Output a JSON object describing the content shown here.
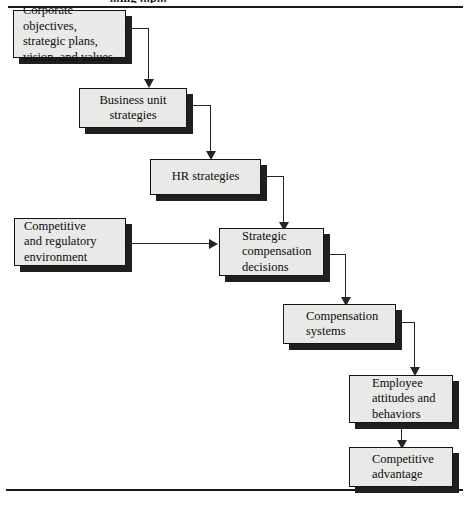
{
  "figure": {
    "title_partial": "...ing ...p...",
    "background_color": "#ffffff",
    "box_fill_color": "#e9e9e7",
    "box_border_color": "#16150f",
    "shadow_color": "#201f1d",
    "connector_color": "#242424"
  },
  "nodes": [
    {
      "id": "corporate-objectives",
      "label": "Corporate objectives,\nstrategic plans,\nvision, and values"
    },
    {
      "id": "business-unit-strategies",
      "label": "Business unit\nstrategies"
    },
    {
      "id": "hr-strategies",
      "label": "HR strategies"
    },
    {
      "id": "competitive-regulatory-environment",
      "label": "Competitive\nand regulatory\nenvironment"
    },
    {
      "id": "strategic-compensation-decisions",
      "label": "Strategic\ncompensation\ndecisions"
    },
    {
      "id": "compensation-systems",
      "label": "Compensation\nsystems"
    },
    {
      "id": "employee-attitudes-behaviors",
      "label": "Employee\nattitudes and\nbehaviors"
    },
    {
      "id": "competitive-advantage",
      "label": "Competitive\nadvantage"
    }
  ],
  "edges": [
    {
      "id": "edge-1",
      "from": "corporate-objectives",
      "to": "business-unit-strategies",
      "kind": "elbow-down"
    },
    {
      "id": "edge-2",
      "from": "business-unit-strategies",
      "to": "hr-strategies",
      "kind": "elbow-down"
    },
    {
      "id": "edge-3",
      "from": "hr-strategies",
      "to": "strategic-compensation-decisions",
      "kind": "elbow-down"
    },
    {
      "id": "edge-4",
      "from": "competitive-regulatory-environment",
      "to": "strategic-compensation-decisions",
      "kind": "straight-right"
    },
    {
      "id": "edge-5",
      "from": "strategic-compensation-decisions",
      "to": "compensation-systems",
      "kind": "elbow-down"
    },
    {
      "id": "edge-6",
      "from": "compensation-systems",
      "to": "employee-attitudes-behaviors",
      "kind": "elbow-down"
    },
    {
      "id": "edge-7",
      "from": "employee-attitudes-behaviors",
      "to": "competitive-advantage",
      "kind": "straight-down"
    }
  ]
}
